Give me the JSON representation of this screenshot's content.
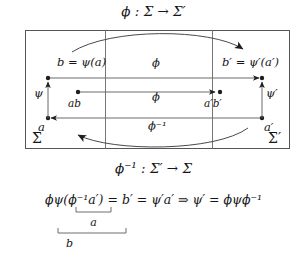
{
  "figure": {
    "type": "commutative-diagram",
    "caption_top": "ϕ : Σ → Σ′",
    "caption_bottom": "ϕ⁻¹ : Σ′ → Σ",
    "equation": "ϕψ(ϕ⁻¹a′) = b′ = ψ′a′ ⇒ ψ′ = ϕψϕ⁻¹",
    "brace_inner_label": "a",
    "brace_outer_label": "b",
    "stroke_color": "#3a3a3a",
    "text_color": "#161616",
    "background_color": "#ffffff"
  },
  "labels": {
    "b_equals_psi_a": "b = ψ(a)",
    "phi_top": "ϕ",
    "b_prime_equals_psi_prime_a_prime": "b′ = ψ′(a′)",
    "psi": "ψ",
    "ab": "ab",
    "phi_middle": "ϕ",
    "a_prime_b_prime": "a′b′",
    "psi_prime": "ψ′",
    "phi_inverse": "ϕ⁻¹",
    "a": "a",
    "a_prime": "a′",
    "sigma": "Σ",
    "sigma_prime": "Σ′"
  },
  "nodes": [
    {
      "name": "b",
      "x": 48,
      "y": 78,
      "label": "b = ψ(a)"
    },
    {
      "name": "ab",
      "x": 78,
      "y": 92,
      "label": "ab"
    },
    {
      "name": "a",
      "x": 48,
      "y": 118,
      "label": "a"
    },
    {
      "name": "b_prime",
      "x": 262,
      "y": 78,
      "label": "b′ = ψ′(a′)"
    },
    {
      "name": "a_prime_b_prime",
      "x": 218,
      "y": 92,
      "label": "a′b′"
    },
    {
      "name": "a_prime",
      "x": 262,
      "y": 118,
      "label": "a′"
    }
  ],
  "edges": [
    {
      "name": "phi-top-edge",
      "from": "b",
      "to": "b_prime",
      "label": "ϕ"
    },
    {
      "name": "phi-middle-edge",
      "from": "ab",
      "to": "a_prime_b_prime",
      "label": "ϕ"
    },
    {
      "name": "phi-inverse-edge",
      "from": "a_prime",
      "to": "a",
      "label": "ϕ⁻¹"
    },
    {
      "name": "psi-edge",
      "from": "a",
      "to": "b",
      "label": "ψ"
    },
    {
      "name": "psi-prime-edge",
      "from": "a_prime",
      "to": "b_prime",
      "label": "ψ′"
    }
  ],
  "regions": [
    {
      "name": "sigma-region",
      "label": "Σ"
    },
    {
      "name": "sigma-prime-region",
      "label": "Σ′"
    }
  ]
}
